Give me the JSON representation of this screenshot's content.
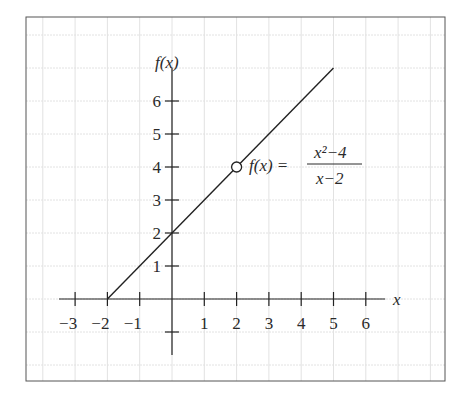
{
  "chart_data": {
    "type": "line",
    "title": "",
    "xlabel": "x",
    "ylabel": "f(x)",
    "xlim": [
      -4.3,
      8.1
    ],
    "ylim": [
      -2.5,
      8.2
    ],
    "x_ticks": [
      -3,
      -2,
      -1,
      1,
      2,
      3,
      4,
      5,
      6
    ],
    "x_tick_labels": [
      "−3",
      "−2",
      "−1",
      "1",
      "2",
      "3",
      "4",
      "5",
      "6"
    ],
    "y_ticks": [
      1,
      2,
      3,
      4,
      5,
      6,
      -1
    ],
    "y_tick_labels": [
      "1",
      "2",
      "3",
      "4",
      "5",
      "6",
      ""
    ],
    "grid": true,
    "series": [
      {
        "name": "f(x) = (x^2-4)/(x-2)",
        "x": [
          -2,
          5
        ],
        "y": [
          0,
          7
        ]
      }
    ],
    "hole": {
      "x": 2,
      "y": 4
    },
    "annotation": {
      "lhs": "f(x) =",
      "numerator": "x²−4",
      "denominator": "x−2",
      "at": {
        "x": 2.25,
        "y": 4
      }
    }
  }
}
